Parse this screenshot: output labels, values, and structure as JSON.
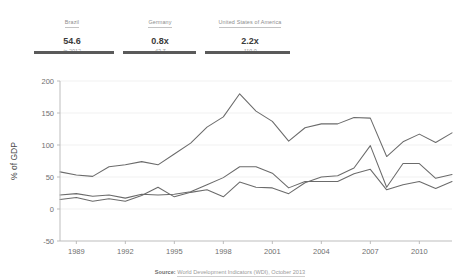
{
  "header": {
    "columns": [
      {
        "name": "Brazil",
        "value": "54.6",
        "sub": "in 2012"
      },
      {
        "name": "Germany",
        "value": "0.8x",
        "sub": "43.7"
      },
      {
        "name": "United States of America",
        "value": "2.2x",
        "sub": "119.0"
      }
    ]
  },
  "source": {
    "label": "Source:",
    "text": "World Development Indicators (WDI), October 2013"
  },
  "chart_data": {
    "type": "line",
    "title": "",
    "xlabel": "",
    "ylabel": "% of GDP",
    "xlim": [
      1988,
      2012
    ],
    "ylim": [
      -50,
      200
    ],
    "yticks": [
      -50,
      0,
      50,
      100,
      150,
      200
    ],
    "xticks": [
      1989,
      1992,
      1995,
      1998,
      2001,
      2004,
      2007,
      2010
    ],
    "grid": true,
    "legend": "none",
    "line_color": "#6b6b6b",
    "x": [
      1988,
      1989,
      1990,
      1991,
      1992,
      1993,
      1994,
      1995,
      1996,
      1997,
      1998,
      1999,
      2000,
      2001,
      2002,
      2003,
      2004,
      2005,
      2006,
      2007,
      2008,
      2009,
      2010,
      2011,
      2012
    ],
    "series": [
      {
        "name": "United States of America",
        "values": [
          58,
          53,
          51,
          66,
          69,
          74,
          69,
          86,
          103,
          128,
          144,
          180,
          153,
          137,
          106,
          127,
          133,
          133,
          143,
          142,
          82,
          105,
          117,
          104,
          119
        ]
      },
      {
        "name": "Germany",
        "values": [
          22,
          24,
          20,
          22,
          17,
          23,
          22,
          23,
          27,
          38,
          49,
          66,
          66,
          56,
          33,
          43,
          43,
          43,
          55,
          62,
          30,
          38,
          43,
          32,
          43
        ]
      },
      {
        "name": "Brazil",
        "values": [
          15,
          18,
          12,
          16,
          12,
          21,
          34,
          19,
          26,
          30,
          19,
          42,
          34,
          33,
          24,
          41,
          50,
          52,
          64,
          99,
          34,
          71,
          71,
          48,
          54
        ]
      }
    ]
  }
}
